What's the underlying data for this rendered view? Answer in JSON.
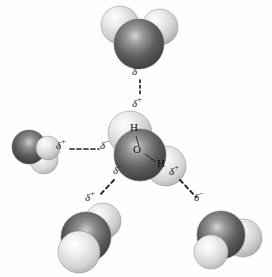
{
  "figure": {
    "background_color": "#fefefe",
    "width": 272,
    "height": 277
  },
  "palette": {
    "oxygen_dark": "#4a4a4a",
    "oxygen_mid": "#6e6e6e",
    "oxygen_highlight": "#d8d8d8",
    "hydrogen_light": "#e9e9e9",
    "hydrogen_mid": "#cfcfcf",
    "hydrogen_highlight": "#fbfbfb",
    "outline": "#8a8a8a",
    "label_color": "#121212",
    "bond_color": "#2a2a2a"
  },
  "central_molecule": {
    "name": "central-water-molecule",
    "atom_labels": [
      {
        "symbol": "H",
        "x": 133,
        "y": 128
      },
      {
        "symbol": "O",
        "x": 137,
        "y": 150
      },
      {
        "symbol": "H",
        "x": 160,
        "y": 163
      }
    ]
  },
  "neighbor_molecules": [
    {
      "name": "water-molecule-top",
      "position": "top"
    },
    {
      "name": "water-molecule-left",
      "position": "left"
    },
    {
      "name": "water-molecule-bottom-left",
      "position": "bottom-left"
    },
    {
      "name": "water-molecule-bottom-right",
      "position": "bottom-right"
    }
  ],
  "hydrogen_bonds": [
    {
      "name": "hydrogen-bond-top",
      "from_label": "δ",
      "from_sign": "−",
      "to_label": "δ",
      "to_sign": "+",
      "from_x": 138,
      "from_y": 71,
      "to_x": 138,
      "to_y": 104,
      "line": {
        "x1": 140,
        "y1": 80,
        "x2": 140,
        "y2": 96
      }
    },
    {
      "name": "hydrogen-bond-left",
      "from_label": "δ",
      "from_sign": "+",
      "to_label": "δ",
      "to_sign": "−",
      "from_x": 55,
      "from_y": 144,
      "to_x": 100,
      "to_y": 144,
      "line": {
        "x1": 70,
        "y1": 150,
        "x2": 99,
        "y2": 150
      }
    },
    {
      "name": "hydrogen-bond-bottom-left",
      "from_label": "δ",
      "from_sign": "−",
      "to_label": "δ",
      "to_sign": "+",
      "from_x": 113,
      "from_y": 168,
      "to_x": 89,
      "to_y": 196,
      "line": {
        "x1": 113,
        "y1": 180,
        "x2": 98,
        "y2": 196
      }
    },
    {
      "name": "hydrogen-bond-bottom-right",
      "from_label": "δ",
      "from_sign": "+",
      "to_label": "δ",
      "to_sign": "−",
      "from_x": 171,
      "from_y": 170,
      "to_x": 196,
      "to_y": 196,
      "line": {
        "x1": 180,
        "y1": 180,
        "x2": 196,
        "y2": 197
      }
    }
  ],
  "labels": {
    "delta": "δ",
    "plus": "+",
    "minus": "−",
    "hydrogen": "H",
    "oxygen": "O"
  }
}
